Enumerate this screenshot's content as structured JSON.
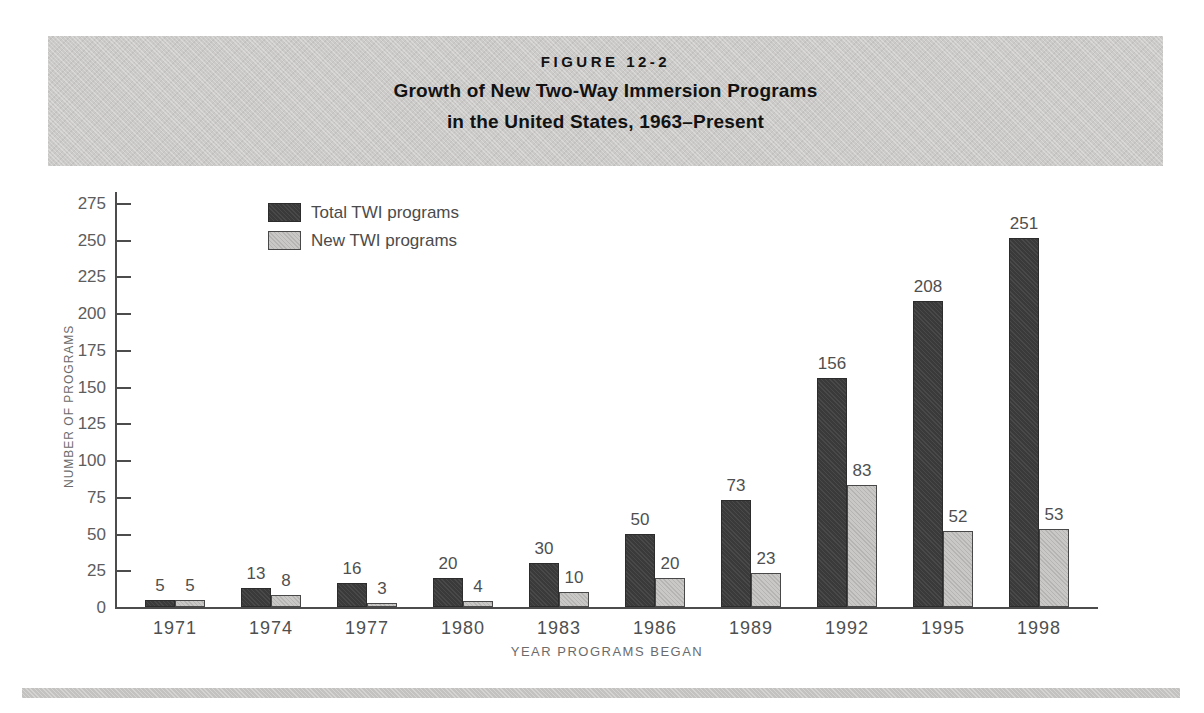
{
  "figure": {
    "label": "FIGURE 12-2",
    "title_line1": "Growth of New Two-Way Immersion Programs",
    "title_line2": "in the United States, 1963–Present"
  },
  "chart_data": {
    "type": "bar",
    "title": "Growth of New Two-Way Immersion Programs in the United States, 1963–Present",
    "categories": [
      "1971",
      "1974",
      "1977",
      "1980",
      "1983",
      "1986",
      "1989",
      "1992",
      "1995",
      "1998"
    ],
    "series": [
      {
        "name": "Total TWI programs",
        "color": "#3a3a3a",
        "values": [
          5,
          13,
          16,
          20,
          30,
          50,
          73,
          156,
          208,
          251
        ]
      },
      {
        "name": "New TWI programs",
        "color": "#c9c8c6",
        "values": [
          5,
          8,
          3,
          4,
          10,
          20,
          23,
          83,
          52,
          53
        ]
      }
    ],
    "xlabel": "YEAR PROGRAMS BEGAN",
    "ylabel": "NUMBER OF PROGRAMS",
    "ylim": [
      0,
      275
    ],
    "ytick_step": 25,
    "grid": false,
    "legend_position": "top-left",
    "bar_value_labels": true
  },
  "colors": {
    "header_band": "#cbcac8",
    "axis": "#4c4c4c",
    "tick_text": "#5d5d5d",
    "label_text": "#4f4f4f",
    "bottom_rule": "#c3c2c0"
  }
}
